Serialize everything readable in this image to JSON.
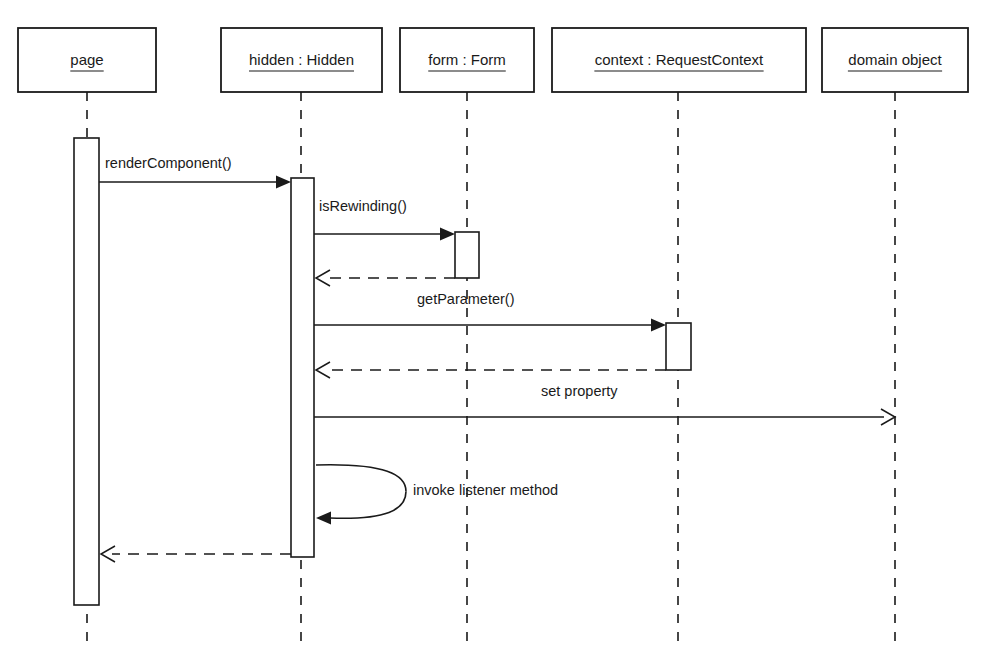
{
  "diagram": {
    "type": "uml-sequence-diagram",
    "width": 998,
    "height": 664,
    "background_color": "#ffffff",
    "line_color": "#1a1a1a"
  },
  "lifelines": [
    {
      "id": "page",
      "label": "page",
      "box": {
        "x": 18,
        "y": 28,
        "w": 138,
        "h": 64
      },
      "line_x": 87,
      "line_top": 92,
      "line_bottom": 645
    },
    {
      "id": "hidden",
      "label": "hidden : Hidden",
      "box": {
        "x": 221,
        "y": 28,
        "w": 161,
        "h": 64
      },
      "line_x": 301,
      "line_top": 92,
      "line_bottom": 645
    },
    {
      "id": "form",
      "label": "form : Form",
      "box": {
        "x": 400,
        "y": 28,
        "w": 134,
        "h": 64
      },
      "line_x": 467,
      "line_top": 92,
      "line_bottom": 645
    },
    {
      "id": "context",
      "label": "context : RequestContext",
      "box": {
        "x": 552,
        "y": 28,
        "w": 254,
        "h": 64
      },
      "line_x": 678,
      "line_top": 92,
      "line_bottom": 645
    },
    {
      "id": "domain",
      "label": "domain object",
      "box": {
        "x": 822,
        "y": 28,
        "w": 146,
        "h": 64
      },
      "line_x": 895,
      "line_top": 92,
      "line_bottom": 645
    }
  ],
  "activations": [
    {
      "id": "page-activation",
      "lifeline": "page",
      "x": 74,
      "y": 138,
      "w": 25,
      "h": 467
    },
    {
      "id": "hidden-activation",
      "lifeline": "hidden",
      "x": 291,
      "y": 178,
      "w": 23,
      "h": 379
    },
    {
      "id": "form-activation",
      "lifeline": "form",
      "x": 455,
      "y": 232,
      "w": 24,
      "h": 46
    },
    {
      "id": "context-activation",
      "lifeline": "context",
      "x": 666,
      "y": 323,
      "w": 25,
      "h": 47
    }
  ],
  "messages": [
    {
      "id": "msg-render-component",
      "label": "renderComponent()",
      "from": "page",
      "to": "hidden",
      "kind": "call",
      "style": "solid",
      "arrowhead": "filled",
      "x1": 99,
      "x2": 291,
      "y": 182,
      "label_x": 105,
      "label_y": 168
    },
    {
      "id": "msg-is-rewinding",
      "label": "isRewinding()",
      "from": "hidden",
      "to": "form",
      "kind": "call",
      "style": "solid",
      "arrowhead": "filled",
      "x1": 314,
      "x2": 455,
      "y": 234,
      "label_x": 319,
      "label_y": 211
    },
    {
      "id": "msg-is-rewinding-return",
      "label": "",
      "from": "form",
      "to": "hidden",
      "kind": "return",
      "style": "dashed",
      "arrowhead": "open",
      "x1": 455,
      "x2": 316,
      "y": 278,
      "label_x": 0,
      "label_y": 0
    },
    {
      "id": "msg-get-parameter",
      "label": "getParameter()",
      "from": "hidden",
      "to": "context",
      "kind": "call",
      "style": "solid",
      "arrowhead": "filled",
      "x1": 314,
      "x2": 666,
      "y": 325,
      "label_x": 417,
      "label_y": 304
    },
    {
      "id": "msg-get-parameter-return",
      "label": "",
      "from": "context",
      "to": "hidden",
      "kind": "return",
      "style": "dashed",
      "arrowhead": "open",
      "x1": 666,
      "x2": 316,
      "y": 370,
      "label_x": 0,
      "label_y": 0
    },
    {
      "id": "msg-set-property",
      "label": "set property",
      "from": "hidden",
      "to": "domain",
      "kind": "call",
      "style": "solid",
      "arrowhead": "open",
      "x1": 314,
      "x2": 895,
      "y": 417,
      "label_x": 541,
      "label_y": 396
    },
    {
      "id": "msg-final-return",
      "label": "",
      "from": "hidden",
      "to": "page",
      "kind": "return",
      "style": "dashed",
      "arrowhead": "open",
      "x1": 291,
      "x2": 101,
      "y": 554,
      "label_x": 0,
      "label_y": 0
    }
  ],
  "self_messages": [
    {
      "id": "msg-invoke-listener",
      "label": "invoke listener method",
      "lifeline": "hidden",
      "kind": "self-call",
      "arrowhead": "filled",
      "x_start": 316,
      "y_start": 465,
      "x_extent": 406,
      "y_end": 518,
      "label_x": 413,
      "label_y": 495
    }
  ]
}
